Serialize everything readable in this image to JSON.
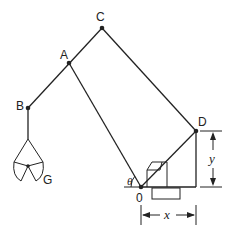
{
  "diagram": {
    "type": "robot-arm-linkage",
    "points": {
      "A": {
        "label": "A"
      },
      "B": {
        "label": "B"
      },
      "C": {
        "label": "C"
      },
      "D": {
        "label": "D"
      },
      "O": {
        "label": "0"
      },
      "G": {
        "label": "G"
      }
    },
    "angle_label": "θ",
    "dimensions": {
      "horizontal": "x",
      "vertical": "y"
    },
    "colors": {
      "line": "#222222",
      "background": "#ffffff"
    }
  }
}
